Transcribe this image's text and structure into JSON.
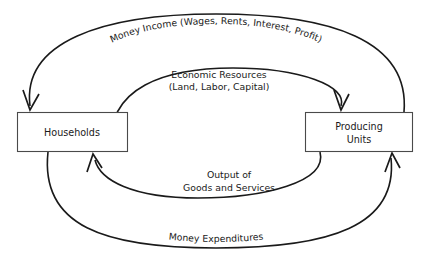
{
  "diagram": {
    "type": "circular-flow-diagram",
    "title": "",
    "background_color": "#ffffff",
    "line_color": "#1a1a1a",
    "box_border_color": "#4a4a4a",
    "entities": [
      {
        "id": "households",
        "label": "Households",
        "label_lines": [
          "Households"
        ]
      },
      {
        "id": "producing-units",
        "label": "Producing Units",
        "label_lines": [
          "Producing",
          "Units"
        ]
      }
    ],
    "flows": [
      {
        "id": "money-income",
        "label": "Money Income (Wages, Rents, Interest, Profit)",
        "from": "producing-units",
        "to": "households",
        "position": "outer-top",
        "curved_text": true
      },
      {
        "id": "economic-resources",
        "label": "Economic Resources (Land, Labor, Capital)",
        "label_lines": [
          "Economic Resources",
          "(Land, Labor, Capital)"
        ],
        "from": "households",
        "to": "producing-units",
        "position": "inner-top",
        "curved_text": false
      },
      {
        "id": "output-goods-services",
        "label": "Output of Goods and Services",
        "label_lines": [
          "Output of",
          "Goods and Services"
        ],
        "from": "producing-units",
        "to": "households",
        "position": "inner-bottom",
        "curved_text": false
      },
      {
        "id": "money-expenditures",
        "label": "Money Expenditures",
        "from": "households",
        "to": "producing-units",
        "position": "outer-bottom",
        "curved_text": true
      }
    ]
  }
}
